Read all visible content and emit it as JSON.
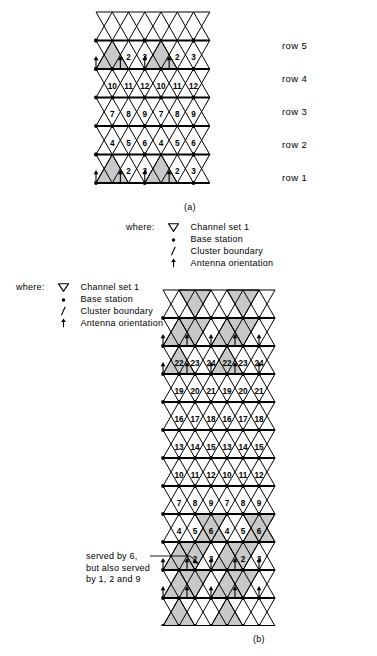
{
  "figures": {
    "a": {
      "caption": "(a)",
      "row_labels": [
        "row 1",
        "row 2",
        "row 3",
        "row 4",
        "row 5"
      ],
      "rows": [
        {
          "label": "row 5",
          "values": [
            1,
            2,
            3,
            1,
            2,
            3
          ],
          "shaded_value": 1
        },
        {
          "label": "row 4",
          "values": [
            10,
            11,
            12,
            10,
            11,
            12
          ],
          "shaded_value": null
        },
        {
          "label": "row 3",
          "values": [
            7,
            8,
            9,
            7,
            8,
            9
          ],
          "shaded_value": null
        },
        {
          "label": "row 2",
          "values": [
            4,
            5,
            6,
            4,
            5,
            6
          ],
          "shaded_value": null
        },
        {
          "label": "row 1",
          "values": [
            1,
            2,
            3,
            1,
            2,
            3
          ],
          "shaded_value": 1
        }
      ]
    },
    "b": {
      "caption": "(b)",
      "rows": [
        {
          "values": [
            22,
            23,
            24,
            22,
            23,
            24,
            22,
            23,
            24
          ]
        },
        {
          "values": [
            19,
            20,
            21,
            19,
            20,
            21,
            19,
            20,
            21
          ]
        },
        {
          "values": [
            16,
            17,
            18,
            16,
            17,
            18,
            16,
            17,
            18
          ]
        },
        {
          "values": [
            13,
            14,
            15,
            13,
            14,
            15,
            13,
            14,
            15
          ]
        },
        {
          "values": [
            10,
            11,
            12,
            10,
            11,
            12,
            10,
            11,
            12
          ]
        },
        {
          "values": [
            7,
            8,
            9,
            7,
            8,
            9,
            7,
            8,
            9
          ]
        },
        {
          "values": [
            4,
            5,
            6,
            4,
            5,
            6,
            4,
            5,
            6
          ]
        },
        {
          "values": [
            1,
            2,
            3,
            1,
            2,
            3,
            1,
            2,
            3
          ]
        }
      ],
      "annotation": {
        "line1": "served by 6,",
        "line2": "but also served",
        "line3": "by 1, 2 and 9"
      }
    }
  },
  "legend_a": {
    "where_label": "where:",
    "items": [
      {
        "symbol": "channel-set-triangle",
        "text": "Channel set 1"
      },
      {
        "symbol": "base-station-dot",
        "text": "Base station"
      },
      {
        "symbol": "cluster-boundary-slash",
        "text": "Cluster boundary"
      },
      {
        "symbol": "antenna-orientation-arrow",
        "text": "Antenna orientation"
      }
    ]
  },
  "legend_b": {
    "where_label": "where:",
    "items": [
      {
        "symbol": "channel-set-triangle",
        "text": "Channel set 1"
      },
      {
        "symbol": "base-station-dot",
        "text": "Base station"
      },
      {
        "symbol": "cluster-boundary-slash",
        "text": "Cluster boundary"
      },
      {
        "symbol": "antenna-orientation-arrow",
        "text": "Antenna orientation"
      }
    ]
  },
  "colors": {
    "shade": "#c8c8c8",
    "line": "#000000",
    "background": "#ffffff"
  }
}
